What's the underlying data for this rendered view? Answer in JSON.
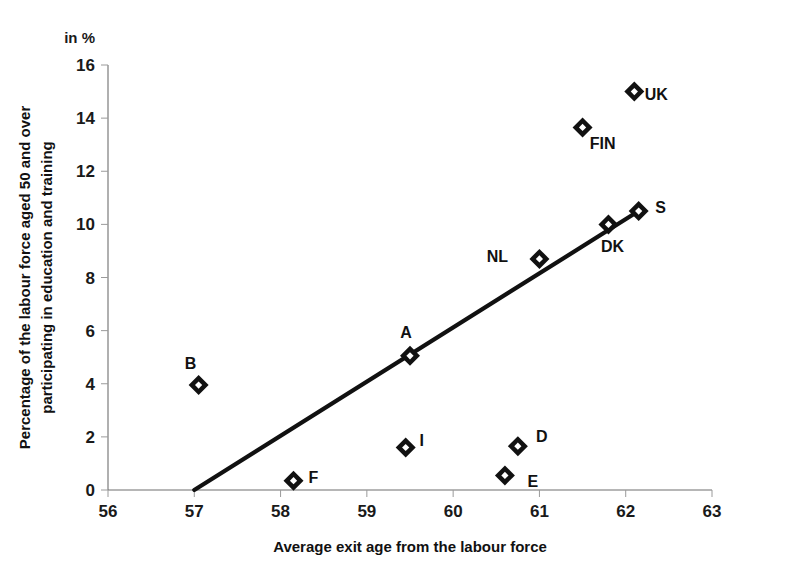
{
  "chart_data": {
    "type": "scatter",
    "title": "",
    "unit_note": "in %",
    "xlabel": "Average exit age from the labour force",
    "ylabel": "Percentage of the labour force aged 50 and over participating in education and training",
    "ylabel_line1": "Percentage of the labour force aged 50 and over",
    "ylabel_line2": "participating in education and training",
    "xlim": [
      56,
      63
    ],
    "ylim": [
      0,
      16
    ],
    "xticks": [
      56,
      57,
      58,
      59,
      60,
      61,
      62,
      63
    ],
    "yticks": [
      0,
      2,
      4,
      6,
      8,
      10,
      12,
      14,
      16
    ],
    "xtick_labels": [
      "56",
      "57",
      "58",
      "59",
      "60",
      "61",
      "62",
      "63"
    ],
    "ytick_labels": [
      "0",
      "2",
      "4",
      "6",
      "8",
      "10",
      "12",
      "14",
      "16"
    ],
    "grid": false,
    "legend": "none",
    "marker_style": "open-diamond",
    "points": [
      {
        "label": "B",
        "x": 57.05,
        "y": 3.95,
        "label_dx": -8,
        "label_dy": -22
      },
      {
        "label": "F",
        "x": 58.15,
        "y": 0.35,
        "label_dx": 20,
        "label_dy": -4
      },
      {
        "label": "I",
        "x": 59.45,
        "y": 1.6,
        "label_dx": 16,
        "label_dy": -8
      },
      {
        "label": "A",
        "x": 59.5,
        "y": 5.05,
        "label_dx": -4,
        "label_dy": -24
      },
      {
        "label": "E",
        "x": 60.6,
        "y": 0.55,
        "label_dx": 28,
        "label_dy": 6
      },
      {
        "label": "D",
        "x": 60.75,
        "y": 1.65,
        "label_dx": 24,
        "label_dy": -10
      },
      {
        "label": "NL",
        "x": 61.0,
        "y": 8.7,
        "label_dx": -42,
        "label_dy": -3
      },
      {
        "label": "FIN",
        "x": 61.5,
        "y": 13.65,
        "label_dx": 20,
        "label_dy": 16
      },
      {
        "label": "DK",
        "x": 61.8,
        "y": 10.0,
        "label_dx": 4,
        "label_dy": 22
      },
      {
        "label": "S",
        "x": 62.15,
        "y": 10.5,
        "label_dx": 22,
        "label_dy": -4
      },
      {
        "label": "UK",
        "x": 62.1,
        "y": 15.0,
        "label_dx": 22,
        "label_dy": 2
      }
    ],
    "trendline": {
      "x_start": 57.0,
      "y_start": 0.0,
      "x_end": 62.15,
      "y_end": 10.5
    },
    "colors": {
      "marker": "#111111",
      "trendline": "#111111",
      "axis": "#6f6f6f",
      "text": "#1a1a1a",
      "background": "#ffffff"
    }
  }
}
